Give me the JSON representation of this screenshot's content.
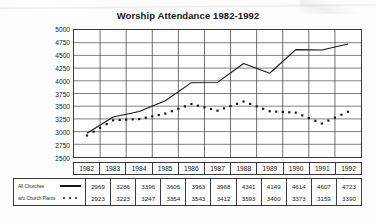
{
  "chart_data": {
    "type": "line",
    "title": "Worship Attendance 1982-1992",
    "xlabel": "",
    "ylabel": "",
    "ylim": [
      2500,
      5000
    ],
    "ytick_step": 250,
    "yticks": [
      5000,
      4750,
      4500,
      4250,
      4000,
      3750,
      3500,
      3250,
      3000,
      2750,
      2500
    ],
    "categories": [
      "1982",
      "1983",
      "1984",
      "1985",
      "1986",
      "1987",
      "1988",
      "1989",
      "1990",
      "1991",
      "1992"
    ],
    "grid": true,
    "legend_position": "bottom-table",
    "series": [
      {
        "name": "All Churches",
        "style": "solid-line",
        "values": [
          2969,
          3286,
          3396,
          3606,
          3963,
          3968,
          4341,
          4149,
          4614,
          4607,
          4723
        ]
      },
      {
        "name": "w/o Church Plants",
        "style": "dotted",
        "values": [
          2923,
          3223,
          3247,
          3354,
          3543,
          3412,
          3593,
          3400,
          3373,
          3159,
          3390
        ]
      }
    ]
  },
  "colors": {
    "ink": "#15161a",
    "grid": "#4a4a4a",
    "frame": "#3a3a3a",
    "page": "#fdfdfd"
  }
}
